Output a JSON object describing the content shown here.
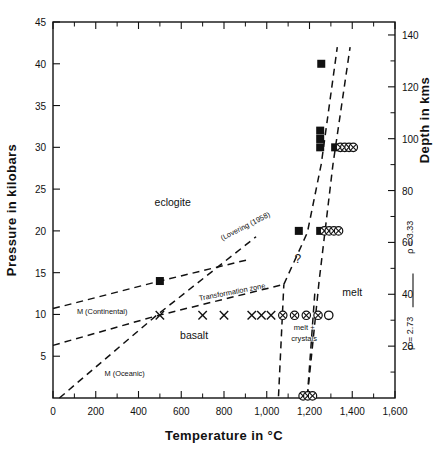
{
  "figure": {
    "name": "basalt-eclogite-phase-diagram"
  },
  "axes": {
    "x": {
      "title": "Temperature in °C",
      "min": 0,
      "max": 1600,
      "major_step": 200,
      "minor_step": 100,
      "ticks": [
        "0",
        "200",
        "400",
        "600",
        "800",
        "1,000",
        "1,200",
        "1,400",
        "1,600"
      ]
    },
    "y_left": {
      "title": "Pressure in kilobars",
      "min": 0,
      "max": 45,
      "major_step": 5,
      "ticks": [
        "45",
        "40",
        "35",
        "30",
        "25",
        "20",
        "15",
        "10",
        "5"
      ]
    },
    "y_right": {
      "title": "Depth in kms",
      "min": 0,
      "max": 145,
      "major_step": 20,
      "minor_step": 10,
      "ticks": [
        "140",
        "120",
        "100",
        "80",
        "60",
        "40",
        "20"
      ]
    },
    "density": {
      "upper": "ρ = 3.33",
      "lower": "ρ = 2.73"
    }
  },
  "region_labels": [
    {
      "id": "eclogite",
      "text": "eclogite",
      "x": 560,
      "y": 23.0
    },
    {
      "id": "basalt",
      "text": "basalt",
      "x": 660,
      "y": 7.1
    },
    {
      "id": "melt",
      "text": "melt",
      "x": 1400,
      "y": 12.2
    },
    {
      "id": "melt-crystals-1",
      "text": "melt +",
      "x": 1175,
      "y": 8.1
    },
    {
      "id": "melt-crystals-2",
      "text": "crystals",
      "x": 1175,
      "y": 6.8
    },
    {
      "id": "question-mark",
      "text": "?",
      "x": 1145,
      "y": 16.2
    }
  ],
  "curve_labels": [
    {
      "id": "lovering",
      "text": "(Lovering (1958)",
      "x": 905,
      "y": 20.3,
      "rotate": -27
    },
    {
      "id": "transformation-zone",
      "text": "Transformation zone",
      "x": 840,
      "y": 12.4,
      "rotate": -11
    },
    {
      "id": "m-continental",
      "text": "M (Continental)",
      "x": 230,
      "y": 10.0,
      "rotate": 0
    },
    {
      "id": "m-oceanic",
      "text": "M (Oceanic)",
      "x": 335,
      "y": 2.6,
      "rotate": 0
    }
  ],
  "chart_data": {
    "type": "scatter",
    "xlabel": "Temperature in °C",
    "ylabel": "Pressure in kilobars",
    "ylabel_secondary": "Depth in kms",
    "xlim": [
      0,
      1600
    ],
    "ylim": [
      0,
      45
    ],
    "ylim_secondary": [
      0,
      145
    ],
    "grid": false,
    "legend": "none",
    "series": [
      {
        "name": "filled-square-points",
        "marker": "filled-square",
        "points": [
          {
            "x": 500,
            "y": 14
          },
          {
            "x": 1255,
            "y": 40
          },
          {
            "x": 1250,
            "y": 32
          },
          {
            "x": 1250,
            "y": 31
          },
          {
            "x": 1250,
            "y": 30
          },
          {
            "x": 1320,
            "y": 30
          },
          {
            "x": 1150,
            "y": 20
          },
          {
            "x": 1250,
            "y": 20
          }
        ]
      },
      {
        "name": "cross-points",
        "marker": "cross",
        "points": [
          {
            "x": 500,
            "y": 9.9
          },
          {
            "x": 700,
            "y": 9.9
          },
          {
            "x": 800,
            "y": 9.9
          },
          {
            "x": 930,
            "y": 9.9
          },
          {
            "x": 975,
            "y": 9.9
          },
          {
            "x": 1020,
            "y": 9.9
          }
        ]
      },
      {
        "name": "circled-cross-points",
        "marker": "circled-cross",
        "points": [
          {
            "x": 1075,
            "y": 9.9
          },
          {
            "x": 1130,
            "y": 9.9
          },
          {
            "x": 1185,
            "y": 9.9
          },
          {
            "x": 1240,
            "y": 9.9
          },
          {
            "x": 1345,
            "y": 30
          },
          {
            "x": 1365,
            "y": 30
          },
          {
            "x": 1385,
            "y": 30
          },
          {
            "x": 1405,
            "y": 30
          },
          {
            "x": 1270,
            "y": 20
          },
          {
            "x": 1292,
            "y": 20
          },
          {
            "x": 1314,
            "y": 20
          },
          {
            "x": 1336,
            "y": 20
          },
          {
            "x": 1170,
            "y": 0.25
          },
          {
            "x": 1192,
            "y": 0.25
          },
          {
            "x": 1214,
            "y": 0.25
          }
        ]
      },
      {
        "name": "open-circle-points",
        "marker": "open-circle",
        "points": [
          {
            "x": 1290,
            "y": 9.9
          }
        ]
      }
    ],
    "boundary_lines": [
      {
        "name": "m-continental-line",
        "style": "dashed",
        "points": [
          [
            0,
            10.7
          ],
          [
            500,
            14.0
          ],
          [
            920,
            16.6
          ]
        ]
      },
      {
        "name": "transformation-zone-lower-line",
        "style": "dashed",
        "points": [
          [
            0,
            6.3
          ],
          [
            480,
            9.8
          ],
          [
            1080,
            13.6
          ]
        ]
      },
      {
        "name": "m-oceanic-line",
        "style": "dashed",
        "points": [
          [
            30,
            0
          ],
          [
            480,
            9.8
          ],
          [
            950,
            19.3
          ]
        ]
      },
      {
        "name": "eclogite-melt-boundary",
        "style": "dashed",
        "points": [
          [
            1080,
            13.6
          ],
          [
            1190,
            19.8
          ],
          [
            1255,
            28.0
          ],
          [
            1330,
            42.0
          ]
        ]
      },
      {
        "name": "melt-liquidus-boundary",
        "style": "dashed",
        "points": [
          [
            1190,
            0.2
          ],
          [
            1245,
            14.0
          ],
          [
            1310,
            28.0
          ],
          [
            1390,
            42.0
          ]
        ]
      },
      {
        "name": "melt-crystals-left-boundary",
        "style": "dashed",
        "points": [
          [
            1055,
            0.2
          ],
          [
            1080,
            13.6
          ]
        ]
      },
      {
        "name": "melt-crystals-right-boundary",
        "style": "dashed",
        "points": [
          [
            1190,
            0.2
          ],
          [
            1225,
            12.6
          ]
        ]
      }
    ]
  }
}
